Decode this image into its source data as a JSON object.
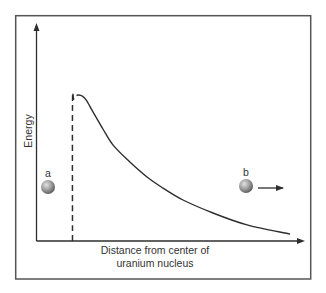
{
  "figure": {
    "frame_color": "#555555",
    "line_color": "#2e2e2e",
    "ball_light": "#d8d8d8",
    "ball_dark": "#5e5e5e"
  },
  "chart_data": {
    "type": "line",
    "title": "",
    "xlabel": "Distance from center of uranium nucleus",
    "xlabel_lines": [
      "Distance from center of",
      "uranium nucleus"
    ],
    "ylabel": "Energy",
    "grid": false,
    "legend": null,
    "axis_ticks": "none (qualitative axes, values normalized 0–1)",
    "xlim": [
      0,
      1
    ],
    "ylim": [
      0,
      1
    ],
    "series": [
      {
        "name": "nuclear potential barrier (dashed inner wall)",
        "style": "dashed",
        "x": [
          0.133,
          0.133,
          0.137,
          0.144,
          0.154
        ],
        "y": [
          0.0,
          0.631,
          0.654,
          0.668,
          0.673
        ]
      },
      {
        "name": "Coulomb repulsion energy (solid)",
        "style": "solid",
        "x": [
          0.154,
          0.169,
          0.184,
          0.21,
          0.247,
          0.285,
          0.348,
          0.412,
          0.472,
          0.547,
          0.659,
          0.787,
          0.948
        ],
        "y": [
          0.673,
          0.668,
          0.65,
          0.594,
          0.516,
          0.442,
          0.364,
          0.295,
          0.244,
          0.189,
          0.129,
          0.074,
          0.032
        ]
      }
    ],
    "annotations": [
      {
        "label": "a",
        "type": "particle",
        "x": 0.041,
        "y": 0.249,
        "note": "particle inside nucleus"
      },
      {
        "label": "b",
        "type": "particle",
        "x": 0.783,
        "y": 0.253,
        "note": "particle outside, moving away",
        "arrow": "right"
      }
    ]
  },
  "layout": {
    "origin_px": [
      37,
      241
    ],
    "x_axis_end_px": 304,
    "y_axis_top_px": 24
  },
  "labels": {
    "ylabel": "Energy",
    "xlabel_line1": "Distance from center of",
    "xlabel_line2": "uranium nucleus",
    "particle_a": "a",
    "particle_b": "b"
  }
}
